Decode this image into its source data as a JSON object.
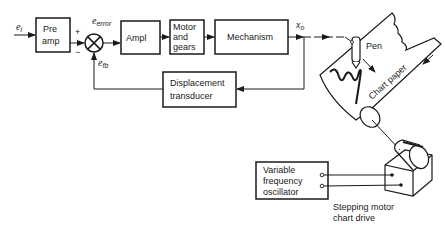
{
  "diagram": {
    "type": "block-diagram",
    "signals": {
      "input": "e",
      "input_sub": "i",
      "error": "e",
      "error_sub": "error",
      "feedback": "e",
      "feedback_sub": "fb",
      "output": "x",
      "output_sub": "o",
      "plus_sign": "+",
      "minus_sign": "−"
    },
    "blocks": {
      "preamp": {
        "line1": "Pre",
        "line2": "amp"
      },
      "ampl": {
        "line1": "Ampl"
      },
      "motor": {
        "line1": "Motor",
        "line2": "and",
        "line3": "gears"
      },
      "mechanism": {
        "line1": "Mechanism"
      },
      "transducer": {
        "line1": "Displacement",
        "line2": "transducer"
      },
      "oscillator": {
        "line1": "Variable",
        "line2": "frequency",
        "line3": "oscillator"
      }
    },
    "labels": {
      "pen": "Pen",
      "chart_paper": "Chart paper",
      "stepping_motor_1": "Stepping motor",
      "stepping_motor_2": "chart drive"
    },
    "colors": {
      "stroke": "#1a1a1a",
      "background": "#ffffff"
    }
  }
}
